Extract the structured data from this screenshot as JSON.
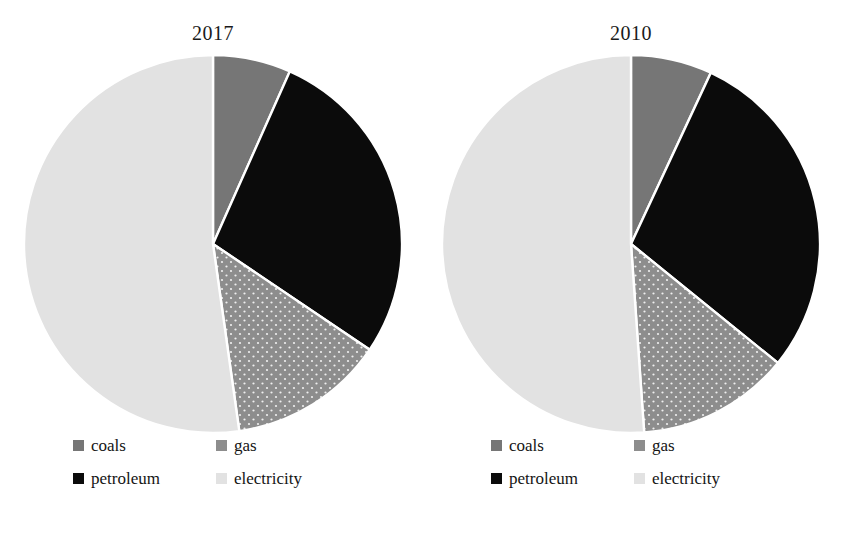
{
  "figure": {
    "background": "#ffffff",
    "panels": [
      "2017",
      "2010"
    ]
  },
  "charts": [
    {
      "id": "pie-2017",
      "title": "2017",
      "legend": [
        {
          "label": "coals",
          "icon": "legend-swatch-coals",
          "color": "#767676"
        },
        {
          "label": "gas",
          "icon": "legend-swatch-gas",
          "color": "#8d8d8d"
        },
        {
          "label": "petroleum",
          "icon": "legend-swatch-petroleum",
          "color": "#0b0b0b"
        },
        {
          "label": "electricity",
          "icon": "legend-swatch-electricity",
          "color": "#e2e2e2"
        }
      ]
    },
    {
      "id": "pie-2010",
      "title": "2010",
      "legend": [
        {
          "label": "coals",
          "icon": "legend-swatch-coals",
          "color": "#767676"
        },
        {
          "label": "gas",
          "icon": "legend-swatch-gas",
          "color": "#8d8d8d"
        },
        {
          "label": "petroleum",
          "icon": "legend-swatch-petroleum",
          "color": "#0b0b0b"
        },
        {
          "label": "electricity",
          "icon": "legend-swatch-electricity",
          "color": "#e2e2e2"
        }
      ]
    }
  ],
  "chart_data": [
    {
      "type": "pie",
      "title": "2017",
      "labels": [
        "coals",
        "petroleum",
        "gas",
        "electricity"
      ],
      "values": [
        6.7,
        27.8,
        13.3,
        52.2
      ],
      "angles_deg": [
        24,
        100,
        48,
        188
      ],
      "colors": [
        "#767676",
        "#0b0b0b",
        "#8d8d8d",
        "#e2e2e2"
      ],
      "start_angle_deg": 0,
      "direction": "clockwise",
      "legend_position": "bottom",
      "grid": false,
      "xlabel": "",
      "ylabel": ""
    },
    {
      "type": "pie",
      "title": "2010",
      "labels": [
        "coals",
        "petroleum",
        "gas",
        "electricity"
      ],
      "values": [
        6.9,
        28.9,
        13.1,
        51.1
      ],
      "angles_deg": [
        25,
        104,
        47,
        184
      ],
      "colors": [
        "#767676",
        "#0b0b0b",
        "#8d8d8d",
        "#e2e2e2"
      ],
      "start_angle_deg": 0,
      "direction": "clockwise",
      "legend_position": "bottom",
      "grid": false,
      "xlabel": "",
      "ylabel": ""
    }
  ]
}
